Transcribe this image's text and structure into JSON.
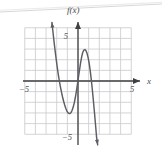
{
  "chart_data": {
    "type": "line",
    "title": "",
    "subtitle": "",
    "function_label": "f(x)",
    "xlabel": "x",
    "ylabel": "",
    "xlim": [
      -5,
      5
    ],
    "ylim": [
      -5,
      5
    ],
    "grid": true,
    "legend": null,
    "x_ticks": [
      -5,
      5
    ],
    "x_tick_labels": [
      "−5",
      "5"
    ],
    "y_ticks": [
      5,
      -5
    ],
    "y_tick_labels": [
      "5",
      "−5"
    ],
    "grid_step": 1,
    "axis_arrows": [
      "x-positive",
      "y-positive"
    ],
    "curve_arrows": [
      "start-up-left",
      "end-down-right"
    ],
    "key_points": {
      "local_minimum": [
        -1.5,
        -3.0
      ],
      "local_maximum": [
        1.2,
        2.8
      ],
      "x_intercepts": [
        -2.7,
        -0.1,
        2.4
      ],
      "y_intercept": [
        0,
        0.2
      ]
    },
    "series": [
      {
        "name": "f(x)",
        "color": "#5d5d63",
        "points": [
          [
            -2.45,
            5.5
          ],
          [
            -2.35,
            4.6
          ],
          [
            -2.25,
            3.7
          ],
          [
            -2.15,
            2.85
          ],
          [
            -2.05,
            2.05
          ],
          [
            -1.95,
            1.3
          ],
          [
            -1.85,
            0.6
          ],
          [
            -1.75,
            0.0
          ],
          [
            -1.65,
            -0.55
          ],
          [
            -1.55,
            -1.05
          ],
          [
            -1.45,
            -1.5
          ],
          [
            -1.35,
            -1.9
          ],
          [
            -1.25,
            -2.25
          ],
          [
            -1.15,
            -2.55
          ],
          [
            -1.05,
            -2.8
          ],
          [
            -0.95,
            -2.97
          ],
          [
            -0.85,
            -3.05
          ],
          [
            -0.75,
            -3.05
          ],
          [
            -0.65,
            -2.95
          ],
          [
            -0.55,
            -2.75
          ],
          [
            -0.45,
            -2.45
          ],
          [
            -0.35,
            -2.05
          ],
          [
            -0.25,
            -1.55
          ],
          [
            -0.15,
            -0.95
          ],
          [
            -0.05,
            -0.3
          ],
          [
            0.05,
            0.4
          ],
          [
            0.15,
            1.1
          ],
          [
            0.25,
            1.75
          ],
          [
            0.35,
            2.3
          ],
          [
            0.45,
            2.7
          ],
          [
            0.55,
            2.9
          ],
          [
            0.65,
            2.95
          ],
          [
            0.75,
            2.85
          ],
          [
            0.85,
            2.6
          ],
          [
            0.95,
            2.2
          ],
          [
            1.05,
            1.65
          ],
          [
            1.15,
            0.95
          ],
          [
            1.25,
            0.1
          ],
          [
            1.35,
            -0.85
          ],
          [
            1.45,
            -1.9
          ],
          [
            1.55,
            -3.0
          ],
          [
            1.65,
            -4.15
          ],
          [
            1.75,
            -5.35
          ],
          [
            1.85,
            -6.0
          ]
        ]
      }
    ]
  },
  "colors": {
    "curve": "#5d5d63",
    "axis": "#3f3f44",
    "grid": "#c9c9cf",
    "text": "#4a4a4a",
    "background": "#ffffff",
    "artifact": "#d8d8dc"
  }
}
